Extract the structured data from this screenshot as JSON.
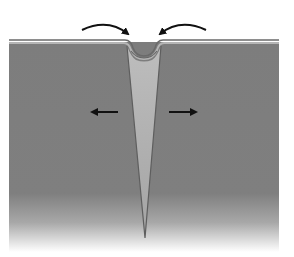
{
  "diagram": {
    "title": "",
    "colors": {
      "ground": "#7d7d7d",
      "ground_top_line": "#6a6a6a",
      "surface_strip": "#b0b0b0",
      "wedge": "#b9b9b9",
      "wedge_edge": "#5e5e5e",
      "arrow": "#111111",
      "background": "#ffffff"
    },
    "elements": [
      {
        "id": "ground-block",
        "label": ""
      },
      {
        "id": "wedge",
        "label": ""
      },
      {
        "id": "curved-arrow-left",
        "direction": "inward-down-right"
      },
      {
        "id": "curved-arrow-right",
        "direction": "inward-down-left"
      },
      {
        "id": "horizontal-arrow-left",
        "direction": "left"
      },
      {
        "id": "horizontal-arrow-right",
        "direction": "right"
      }
    ]
  }
}
